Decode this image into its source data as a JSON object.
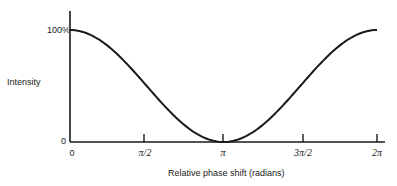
{
  "chart_data": {
    "type": "line",
    "title": "",
    "xlabel": "Relative phase shift (radians)",
    "ylabel": "Intensity",
    "x_tick_labels": [
      "0",
      "π/2",
      "π",
      "3π/2",
      "2π"
    ],
    "x_tick_values": [
      0,
      1.5708,
      3.1416,
      4.7124,
      6.2832
    ],
    "y_tick_labels": [
      "0",
      "100%"
    ],
    "y_tick_values": [
      0,
      100
    ],
    "xlim": [
      0,
      6.2832
    ],
    "ylim": [
      0,
      100
    ],
    "grid": false,
    "legend": null,
    "series": [
      {
        "name": "Intensity",
        "description": "I = cos²(φ/2), maximum 100% at 0 and 2π, zero at π",
        "x": [
          0,
          0.7854,
          1.5708,
          2.3562,
          3.1416,
          3.927,
          4.7124,
          5.4978,
          6.2832
        ],
        "values": [
          100,
          85.4,
          50,
          14.6,
          0,
          14.6,
          50,
          85.4,
          100
        ]
      }
    ]
  },
  "labels": {
    "ylabel": "Intensity",
    "xlabel": "Relative phase shift (radians)",
    "y_top": "100%",
    "y_zero": "0",
    "x_ticks": [
      "0",
      "π/2",
      "π",
      "3π/2",
      "2π"
    ]
  }
}
